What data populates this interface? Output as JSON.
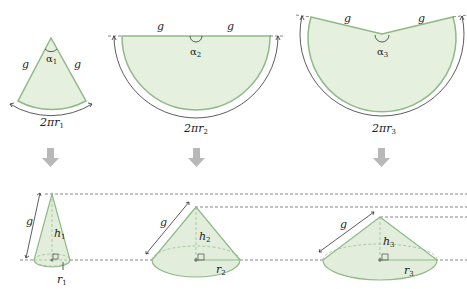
{
  "figure": {
    "sectors": [
      {
        "id": 1,
        "slant_left": "g",
        "slant_right": "g",
        "angle": "α",
        "angle_sub": "1",
        "arc_label": "2πr",
        "arc_sub": "1"
      },
      {
        "id": 2,
        "slant_left": "g",
        "slant_right": "g",
        "angle": "α",
        "angle_sub": "2",
        "arc_label": "2πr",
        "arc_sub": "2"
      },
      {
        "id": 3,
        "slant_left": "g",
        "slant_right": "g",
        "angle": "α",
        "angle_sub": "3",
        "arc_label": "2πr",
        "arc_sub": "3"
      }
    ],
    "arrows": [
      "down-arrow",
      "down-arrow",
      "down-arrow"
    ],
    "cones": [
      {
        "id": 1,
        "slant": "g",
        "height": "h",
        "height_sub": "1",
        "radius": "r",
        "radius_sub": "1"
      },
      {
        "id": 2,
        "slant": "g",
        "height": "h",
        "height_sub": "2",
        "radius": "r",
        "radius_sub": "2"
      },
      {
        "id": 3,
        "slant": "g",
        "height": "h",
        "height_sub": "3",
        "radius": "r",
        "radius_sub": "3"
      }
    ],
    "colors": {
      "fill": "#e6f0df",
      "stroke": "#8fb987",
      "arrow": "#b5b5b5"
    }
  }
}
